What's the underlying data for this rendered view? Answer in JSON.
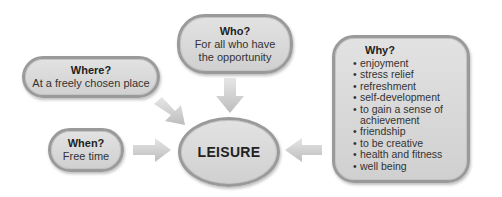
{
  "diagram": {
    "center": {
      "label": "LEISURE"
    },
    "nodes": {
      "where": {
        "question": "Where?",
        "answer": "At a freely chosen place"
      },
      "who": {
        "question": "Who?",
        "answer_line1": "For all who have",
        "answer_line2": "the opportunity"
      },
      "when": {
        "question": "When?",
        "answer": "Free time"
      },
      "why": {
        "question": "Why?",
        "items": [
          "enjoyment",
          "stress relief",
          "refreshment",
          "self-development",
          "to gain a sense of achievement",
          "friendship",
          "to be creative",
          "health and fitness",
          "well being"
        ]
      }
    },
    "colors": {
      "node_fill": "#d8d8d8",
      "node_border": "#9a9a9a",
      "arrow_fill": "#c8c8c8",
      "text": "#2a2a2a"
    },
    "arrows": [
      {
        "from": "Who?",
        "to": "LEISURE",
        "direction": "down"
      },
      {
        "from": "Where?",
        "to": "LEISURE",
        "direction": "down-right"
      },
      {
        "from": "When?",
        "to": "LEISURE",
        "direction": "right"
      },
      {
        "from": "Why?",
        "to": "LEISURE",
        "direction": "left"
      }
    ]
  }
}
